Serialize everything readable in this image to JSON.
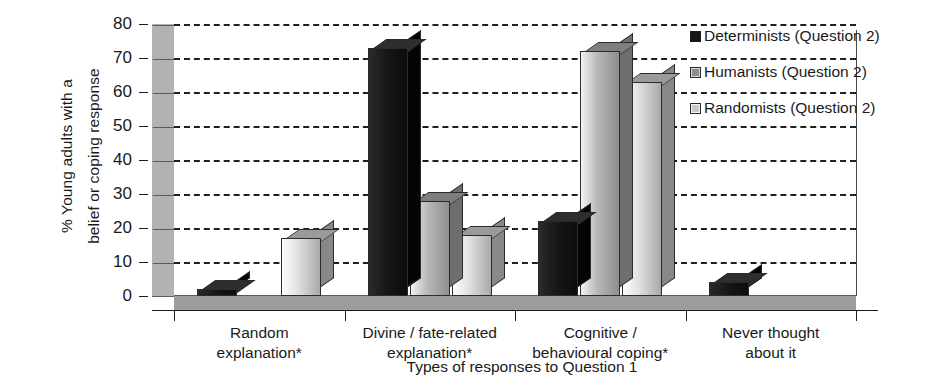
{
  "chart_data": {
    "type": "bar",
    "title": "",
    "xlabel": "Types of responses to Question 1",
    "ylabel": "% Young adults with a belief or coping response",
    "ylabel_lines": [
      "% Young adults with a",
      "belief or coping response"
    ],
    "ylim": [
      0,
      80
    ],
    "yticks": [
      0,
      10,
      20,
      30,
      40,
      50,
      60,
      70,
      80
    ],
    "ytick_labels": [
      "0",
      "10",
      "20",
      "30",
      "40",
      "50",
      "60",
      "70",
      "80"
    ],
    "grid": true,
    "grid_style": "dashed-horizontal",
    "legend_position": "right-top",
    "three_d": true,
    "categories": [
      "Random explanation*",
      "Divine / fate-related explanation*",
      "Cognitive / behavioural coping*",
      "Never thought about it"
    ],
    "category_lines": [
      [
        "Random",
        "explanation*"
      ],
      [
        "Divine / fate-related",
        "explanation*"
      ],
      [
        "Cognitive /",
        "behavioural coping*"
      ],
      [
        "Never thought",
        "about it"
      ]
    ],
    "series": [
      {
        "name": "Determinists (Question 2)",
        "color": "#151515",
        "values": [
          2,
          73,
          22,
          4
        ]
      },
      {
        "name": "Humanists (Question 2)",
        "color": "#8d8d8d",
        "values": [
          0,
          28,
          72,
          0
        ]
      },
      {
        "name": "Randomists (Question 2)",
        "color": "#c9c9c9",
        "values": [
          17,
          18,
          63,
          0
        ]
      }
    ]
  },
  "legend": {
    "items": [
      {
        "label": "Determinists (Question 2)",
        "swatch": "dark"
      },
      {
        "label": "Humanists (Question 2)",
        "swatch": "mid"
      },
      {
        "label": "Randomists (Question 2)",
        "swatch": "light"
      }
    ]
  }
}
